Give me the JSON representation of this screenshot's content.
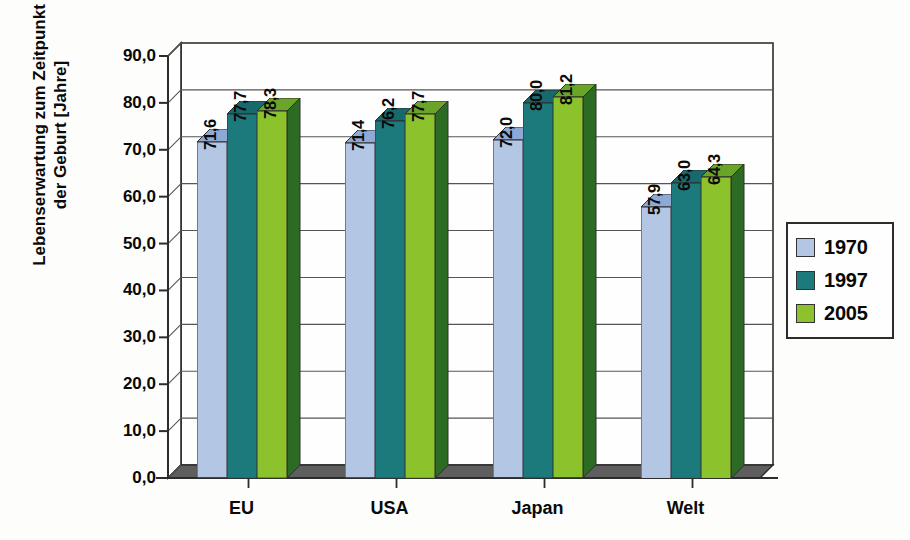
{
  "chart_data": {
    "type": "bar",
    "title": "",
    "subtitle": "",
    "xlabel": "",
    "ylabel": "Lebenserwartung zum Zeitpunkt der Geburt [Jahre]",
    "ylabel_lines": [
      "Lebenserwartung zum Zeitpunkt",
      "der Geburt [Jahre]"
    ],
    "categories": [
      "EU",
      "USA",
      "Japan",
      "Welt"
    ],
    "series": [
      {
        "name": "1970",
        "color": "#b3c6e4",
        "values": [
          71.6,
          71.4,
          72.0,
          57.9
        ]
      },
      {
        "name": "1997",
        "color": "#1d7a7c",
        "values": [
          77.7,
          76.2,
          80.0,
          63.0
        ]
      },
      {
        "name": "2005",
        "color": "#8cc22b",
        "values": [
          78.3,
          77.7,
          81.2,
          64.3
        ]
      }
    ],
    "value_labels": [
      [
        "71,6",
        "77,7",
        "78,3"
      ],
      [
        "71,4",
        "76,2",
        "77,7"
      ],
      [
        "72,0",
        "80,0",
        "81,2"
      ],
      [
        "57,9",
        "63,0",
        "64,3"
      ]
    ],
    "ylim": [
      0,
      90
    ],
    "ytick_step": 10,
    "ytick_labels": [
      "90,0",
      "80,0",
      "70,0",
      "60,0",
      "50,0",
      "40,0",
      "30,0",
      "20,0",
      "10,0",
      "0,0"
    ],
    "ytick_values": [
      90,
      80,
      70,
      60,
      50,
      40,
      30,
      20,
      10,
      0
    ],
    "grid": true,
    "grid_orientation": "horizontal",
    "legend_position": "right",
    "style": "3d-column",
    "decimal_separator": ","
  },
  "legend": {
    "entries": [
      {
        "label": "1970",
        "color": "#b3c6e4"
      },
      {
        "label": "1997",
        "color": "#1d7a7c"
      },
      {
        "label": "2005",
        "color": "#8cc22b"
      }
    ]
  },
  "colors": {
    "background": "#fdfdfb",
    "axis": "#2c2c2c",
    "grid": "#555555",
    "floor": "#5e5e5e",
    "text": "#080808",
    "series_1970": "#b3c6e4",
    "series_1970_side": "#6f8fbe",
    "series_1970_top": "#8ea9d4",
    "series_1997": "#1d7a7c",
    "series_1997_side": "#0d4b4f",
    "series_1997_top": "#17696c",
    "series_2005": "#8cc22b",
    "series_2005_side": "#2c6b24",
    "series_2005_top": "#6aa52a"
  }
}
